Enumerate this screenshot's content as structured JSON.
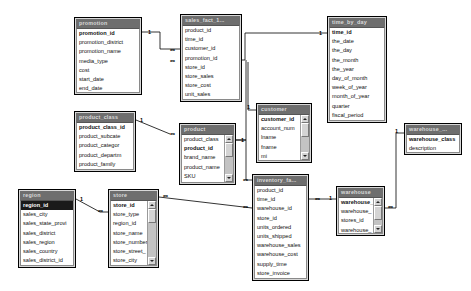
{
  "diagram": {
    "background": "#ffffff",
    "title_bar_color": "#6e6e6e",
    "body_color": "#ffffff",
    "frame_color": "#d8d8d8",
    "selection_color": "#1a1a1a",
    "cardinality_one": "1",
    "cardinality_many": "∞"
  },
  "tables": [
    {
      "id": "promotion",
      "name": "promotion",
      "x": 74,
      "y": 17,
      "w": 68,
      "h": 78,
      "scrollbar": false,
      "fields": [
        {
          "name": "promotion_id",
          "pk": true,
          "selected": false
        },
        {
          "name": "promotion_district",
          "pk": false,
          "selected": false
        },
        {
          "name": "promotion_name",
          "pk": false,
          "selected": false
        },
        {
          "name": "media_type",
          "pk": false,
          "selected": false
        },
        {
          "name": "cost",
          "pk": false,
          "selected": false
        },
        {
          "name": "start_date",
          "pk": false,
          "selected": false
        },
        {
          "name": "end_date",
          "pk": false,
          "selected": false
        }
      ]
    },
    {
      "id": "sales_fact_1",
      "name": "sales_fact_1...",
      "x": 180,
      "y": 14,
      "w": 62,
      "h": 88,
      "scrollbar": false,
      "fields": [
        {
          "name": "product_id",
          "pk": false,
          "selected": false
        },
        {
          "name": "time_id",
          "pk": false,
          "selected": false
        },
        {
          "name": "customer_id",
          "pk": false,
          "selected": false
        },
        {
          "name": "promotion_id",
          "pk": false,
          "selected": false
        },
        {
          "name": "store_id",
          "pk": false,
          "selected": false
        },
        {
          "name": "store_sales",
          "pk": false,
          "selected": false
        },
        {
          "name": "store_cost",
          "pk": false,
          "selected": false
        },
        {
          "name": "unit_sales",
          "pk": false,
          "selected": false
        }
      ]
    },
    {
      "id": "time_by_day",
      "name": "time_by_day",
      "x": 327,
      "y": 16,
      "w": 60,
      "h": 107,
      "scrollbar": false,
      "fields": [
        {
          "name": "time_id",
          "pk": true,
          "selected": false
        },
        {
          "name": "the_date",
          "pk": false,
          "selected": false
        },
        {
          "name": "the_day",
          "pk": false,
          "selected": false
        },
        {
          "name": "the_month",
          "pk": false,
          "selected": false
        },
        {
          "name": "the_year",
          "pk": false,
          "selected": false
        },
        {
          "name": "day_of_month",
          "pk": false,
          "selected": false
        },
        {
          "name": "week_of_year",
          "pk": false,
          "selected": false
        },
        {
          "name": "month_of_year",
          "pk": false,
          "selected": false
        },
        {
          "name": "quarter",
          "pk": false,
          "selected": false
        },
        {
          "name": "fiscal_period",
          "pk": false,
          "selected": false
        }
      ]
    },
    {
      "id": "product_class",
      "name": "product_class",
      "x": 74,
      "y": 111,
      "w": 62,
      "h": 61,
      "scrollbar": false,
      "fields": [
        {
          "name": "product_class_id",
          "pk": true,
          "selected": false
        },
        {
          "name": "product_subcate",
          "pk": false,
          "selected": false
        },
        {
          "name": "product_categor",
          "pk": false,
          "selected": false
        },
        {
          "name": "product_departm",
          "pk": false,
          "selected": false
        },
        {
          "name": "product_family",
          "pk": false,
          "selected": false
        }
      ]
    },
    {
      "id": "product",
      "name": "product",
      "x": 179,
      "y": 123,
      "w": 57,
      "h": 62,
      "scrollbar": true,
      "fields": [
        {
          "name": "product_class",
          "pk": false,
          "selected": false
        },
        {
          "name": "product_id",
          "pk": true,
          "selected": false
        },
        {
          "name": "brand_name",
          "pk": false,
          "selected": false
        },
        {
          "name": "product_name",
          "pk": false,
          "selected": false
        },
        {
          "name": "SKU",
          "pk": false,
          "selected": false
        }
      ]
    },
    {
      "id": "customer",
      "name": "customer",
      "x": 256,
      "y": 103,
      "w": 56,
      "h": 60,
      "scrollbar": true,
      "fields": [
        {
          "name": "customer_id",
          "pk": true,
          "selected": false
        },
        {
          "name": "account_num",
          "pk": false,
          "selected": false
        },
        {
          "name": "lname",
          "pk": false,
          "selected": false
        },
        {
          "name": "fname",
          "pk": false,
          "selected": false
        },
        {
          "name": "mi",
          "pk": false,
          "selected": false
        }
      ]
    },
    {
      "id": "warehouse_class",
      "name": "warehouse_...",
      "x": 404,
      "y": 123,
      "w": 58,
      "h": 32,
      "scrollbar": false,
      "fields": [
        {
          "name": "warehouse_class",
          "pk": true,
          "selected": false
        },
        {
          "name": "description",
          "pk": false,
          "selected": false
        }
      ]
    },
    {
      "id": "region",
      "name": "region",
      "x": 18,
      "y": 189,
      "w": 58,
      "h": 79,
      "scrollbar": false,
      "fields": [
        {
          "name": "region_id",
          "pk": true,
          "selected": true
        },
        {
          "name": "sales_city",
          "pk": false,
          "selected": false
        },
        {
          "name": "sales_state_provi",
          "pk": false,
          "selected": false
        },
        {
          "name": "sales_district",
          "pk": false,
          "selected": false
        },
        {
          "name": "sales_region",
          "pk": false,
          "selected": false
        },
        {
          "name": "sales_country",
          "pk": false,
          "selected": false
        },
        {
          "name": "sales_district_id",
          "pk": false,
          "selected": false
        }
      ]
    },
    {
      "id": "store",
      "name": "store",
      "x": 108,
      "y": 189,
      "w": 51,
      "h": 79,
      "scrollbar": true,
      "fields": [
        {
          "name": "store_id",
          "pk": true,
          "selected": false
        },
        {
          "name": "store_type",
          "pk": false,
          "selected": false
        },
        {
          "name": "region_id",
          "pk": false,
          "selected": false
        },
        {
          "name": "store_name",
          "pk": false,
          "selected": false
        },
        {
          "name": "store_number",
          "pk": false,
          "selected": false
        },
        {
          "name": "store_street_",
          "pk": false,
          "selected": false
        },
        {
          "name": "store_city",
          "pk": false,
          "selected": false
        }
      ]
    },
    {
      "id": "inventory_fact",
      "name": "inventory_fa...",
      "x": 252,
      "y": 174,
      "w": 57,
      "h": 107,
      "scrollbar": false,
      "fields": [
        {
          "name": "product_id",
          "pk": false,
          "selected": false
        },
        {
          "name": "time_id",
          "pk": false,
          "selected": false
        },
        {
          "name": "warehouse_id",
          "pk": false,
          "selected": false
        },
        {
          "name": "store_id",
          "pk": false,
          "selected": false
        },
        {
          "name": "units_ordered",
          "pk": false,
          "selected": false
        },
        {
          "name": "units_shipped",
          "pk": false,
          "selected": false
        },
        {
          "name": "warehouse_sales",
          "pk": false,
          "selected": false
        },
        {
          "name": "warehouse_cost",
          "pk": false,
          "selected": false
        },
        {
          "name": "supply_time",
          "pk": false,
          "selected": false
        },
        {
          "name": "store_invoice",
          "pk": false,
          "selected": false
        }
      ]
    },
    {
      "id": "warehouse",
      "name": "warehouse",
      "x": 336,
      "y": 186,
      "w": 49,
      "h": 50,
      "scrollbar": true,
      "fields": [
        {
          "name": "warehouse_",
          "pk": true,
          "selected": false
        },
        {
          "name": "warehouse_",
          "pk": false,
          "selected": false
        },
        {
          "name": "stores_id",
          "pk": false,
          "selected": false
        },
        {
          "name": "warehouse_",
          "pk": false,
          "selected": false
        }
      ]
    }
  ],
  "relationships": [
    {
      "from": "promotion",
      "to": "sales_fact_1",
      "from_card": "1",
      "to_card": "∞"
    },
    {
      "from": "time_by_day",
      "to": "sales_fact_1",
      "from_card": "1",
      "to_card": "∞"
    },
    {
      "from": "product_class",
      "to": "product",
      "from_card": "1",
      "to_card": "∞"
    },
    {
      "from": "product",
      "to": "sales_fact_1",
      "from_card": "1",
      "to_card": "∞"
    },
    {
      "from": "product",
      "to": "inventory_fact",
      "from_card": "1",
      "to_card": "∞"
    },
    {
      "from": "customer",
      "to": "sales_fact_1",
      "from_card": "1",
      "to_card": "∞"
    },
    {
      "from": "region",
      "to": "store",
      "from_card": "1",
      "to_card": "∞"
    },
    {
      "from": "store",
      "to": "inventory_fact",
      "from_card": "1",
      "to_card": "∞"
    },
    {
      "from": "warehouse",
      "to": "inventory_fact",
      "from_card": "1",
      "to_card": "∞"
    },
    {
      "from": "warehouse_class",
      "to": "warehouse",
      "from_card": "1",
      "to_card": "∞"
    }
  ],
  "cardinality_markers": [
    {
      "label": "1",
      "x": 148,
      "y": 29
    },
    {
      "label": "∞",
      "x": 170,
      "y": 47
    },
    {
      "label": "∞",
      "x": 170,
      "y": 58
    },
    {
      "label": "1",
      "x": 319,
      "y": 30
    },
    {
      "label": "1",
      "x": 247,
      "y": 104
    },
    {
      "label": "1",
      "x": 140,
      "y": 117
    },
    {
      "label": "∞",
      "x": 170,
      "y": 131
    },
    {
      "label": "1",
      "x": 241,
      "y": 137
    },
    {
      "label": "∞",
      "x": 243,
      "y": 177
    },
    {
      "label": "1",
      "x": 395,
      "y": 128
    },
    {
      "label": "1",
      "x": 80,
      "y": 196
    },
    {
      "label": "∞",
      "x": 98,
      "y": 208
    },
    {
      "label": "∞",
      "x": 163,
      "y": 193
    },
    {
      "label": "∞",
      "x": 243,
      "y": 204
    },
    {
      "label": "∞",
      "x": 315,
      "y": 196
    },
    {
      "label": "1",
      "x": 329,
      "y": 195
    },
    {
      "label": "∞",
      "x": 388,
      "y": 204
    }
  ]
}
